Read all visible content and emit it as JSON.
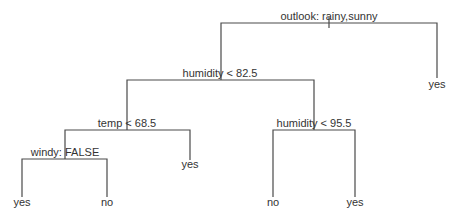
{
  "diagram": {
    "type": "decision-tree",
    "colors": {
      "line": "#4a4a4a",
      "text": "#333333",
      "background": "#ffffff"
    },
    "nodes": {
      "root": {
        "label": "outlook: rainy,sunny"
      },
      "humidity1": {
        "label": "humidity < 82.5"
      },
      "temp": {
        "label": "temp < 68.5"
      },
      "windy": {
        "label": "windy: FALSE"
      },
      "humidity2": {
        "label": "humidity < 95.5"
      }
    },
    "leaves": {
      "root_right": {
        "label": "yes"
      },
      "temp_right": {
        "label": "yes"
      },
      "windy_left": {
        "label": "yes"
      },
      "windy_right": {
        "label": "no"
      },
      "humidity2_left": {
        "label": "no"
      },
      "humidity2_right": {
        "label": "yes"
      }
    }
  }
}
